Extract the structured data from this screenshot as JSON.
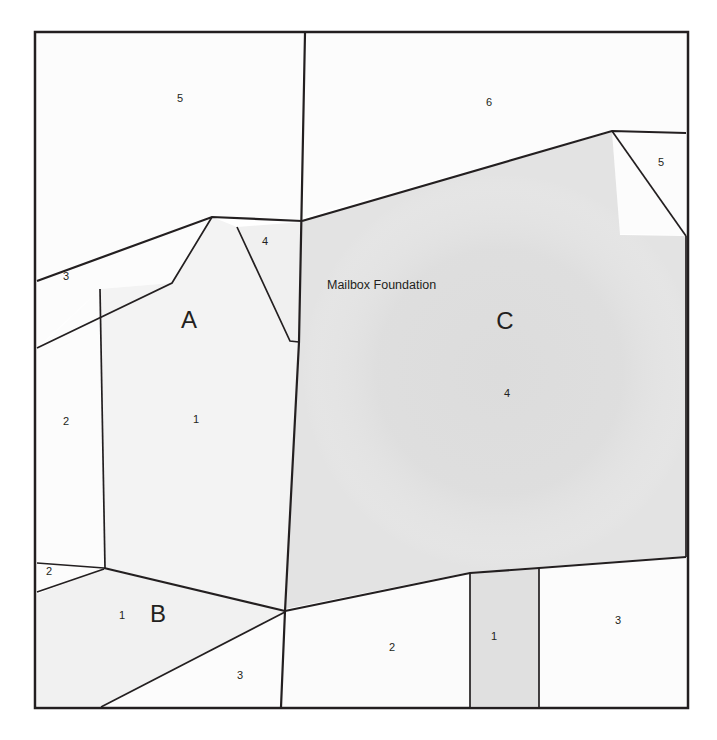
{
  "document": {
    "header_caption": "Survey plat sheet — parcel subdivision",
    "title": "Parcel Plat Diagram"
  },
  "colors": {
    "line": "#231f20",
    "text": "#231f20",
    "parcel_light": "#fbfbfb",
    "parcel_shaded": "#e6e6e6",
    "parcel_shaded_dark": "#dcdcdc",
    "background": "#ffffff",
    "header_text": "#fcfcfc"
  },
  "frame": {
    "x": 35,
    "y": 32,
    "width": 653,
    "height": 676,
    "stroke_width": 2.5
  },
  "annotations": [
    {
      "id": "mailbox-foundation",
      "text": "Mailbox Foundation",
      "x": 327,
      "y": 286
    }
  ],
  "blocks": [
    {
      "id": "block-a",
      "label": "A",
      "x": 189,
      "y": 322
    },
    {
      "id": "block-b",
      "label": "B",
      "x": 158,
      "y": 616
    },
    {
      "id": "block-c",
      "label": "C",
      "x": 505,
      "y": 323
    }
  ],
  "lots": [
    {
      "id": "lot-top-left-5",
      "label": "5",
      "x": 180,
      "y": 99
    },
    {
      "id": "lot-top-right-6",
      "label": "6",
      "x": 489,
      "y": 103
    },
    {
      "id": "lot-right-5",
      "label": "5",
      "x": 661,
      "y": 163
    },
    {
      "id": "lot-left-3",
      "label": "3",
      "x": 66,
      "y": 277
    },
    {
      "id": "lot-mid-4",
      "label": "4",
      "x": 265,
      "y": 242
    },
    {
      "id": "lot-left-2",
      "label": "2",
      "x": 66,
      "y": 422
    },
    {
      "id": "lot-a-1",
      "label": "1",
      "x": 196,
      "y": 420
    },
    {
      "id": "lot-c-4",
      "label": "4",
      "x": 507,
      "y": 394
    },
    {
      "id": "lot-left-small-2",
      "label": "2",
      "x": 49,
      "y": 572
    },
    {
      "id": "lot-b-1",
      "label": "1",
      "x": 122,
      "y": 616
    },
    {
      "id": "lot-bottom-3",
      "label": "3",
      "x": 240,
      "y": 676
    },
    {
      "id": "lot-bottom-2",
      "label": "2",
      "x": 392,
      "y": 648
    },
    {
      "id": "lot-bottom-1",
      "label": "1",
      "x": 494,
      "y": 637
    },
    {
      "id": "lot-bottom-right-3",
      "label": "3",
      "x": 618,
      "y": 621
    }
  ],
  "parcels": [
    {
      "id": "parcel-top-left-5",
      "points": "37,34 303,34 300,222 212,216 37,280",
      "fill": "#fcfcfc"
    },
    {
      "id": "parcel-top-right-6",
      "points": "306,34 686,34 686,133 612,131 302,217",
      "fill": "#fcfcfc"
    },
    {
      "id": "parcel-right-5",
      "points": "612,132 686,134 686,235 620,234",
      "fill": "#fcfcfc"
    },
    {
      "id": "parcel-left-3",
      "points": "37,282 212,217 172,283 100,289 37,348",
      "fill": "#fcfcfc"
    },
    {
      "id": "parcel-mid-4",
      "points": "237,227 302,222 299,341 290,341",
      "fill": "#f0f0f0"
    },
    {
      "id": "parcel-left-2",
      "points": "37,350 100,290 104,568 37,561",
      "fill": "#fcfcfc"
    },
    {
      "id": "parcel-block-a",
      "points": "212,217 237,227 290,341 299,342 285,610 105,568 100,289 172,283",
      "fill": "#f3f3f3"
    },
    {
      "id": "parcel-block-c",
      "points": "302,220 612,132 620,235 686,236 686,556 470,572 285,609 299,342",
      "fill": "#e3e3e3"
    },
    {
      "id": "parcel-left-small-2",
      "points": "37,563 104,568 37,592",
      "fill": "#fcfcfc"
    },
    {
      "id": "parcel-block-b",
      "points": "37,594 104,569 285,611 101,706 37,706",
      "fill": "#f1f1f1"
    },
    {
      "id": "parcel-bottom-3",
      "points": "103,706 285,612 281,706",
      "fill": "#fcfcfc"
    },
    {
      "id": "parcel-bottom-2",
      "points": "286,612 469,573 469,706 282,706",
      "fill": "#fbfbfb"
    },
    {
      "id": "parcel-bottom-1",
      "points": "470,573 539,568 539,706 470,706",
      "fill": "#e0e0e0"
    },
    {
      "id": "parcel-bottom-right-3",
      "points": "540,568 686,558 686,706 540,706",
      "fill": "#fcfcfc"
    }
  ],
  "lines": [
    {
      "id": "line-center-vertical",
      "d": "M 305,33 L 299,342 L 285,611 L 281,707",
      "width": 2.2
    },
    {
      "id": "line-upper-left-diagonal",
      "d": "M 37,281 L 212,217 L 302,221",
      "width": 2.2
    },
    {
      "id": "line-upper-right-diagonal",
      "d": "M 302,221 L 612,131 L 686,133",
      "width": 2.2
    },
    {
      "id": "line-lot3-left-diagonal",
      "d": "M 37,348 L 172,283 L 212,217",
      "width": 1.7
    },
    {
      "id": "line-lot3-vertical",
      "d": "M 100,289 L 105,568",
      "width": 1.7
    },
    {
      "id": "line-lot4-diagonal",
      "d": "M 237,227 L 290,341 L 299,342",
      "width": 1.7
    },
    {
      "id": "line-right-5-diagonal",
      "d": "M 612,131 L 686,236",
      "width": 1.7
    },
    {
      "id": "line-left-small-2-diagonal",
      "d": "M 37,563 L 104,568",
      "width": 1.7
    },
    {
      "id": "line-left-small-2-lower",
      "d": "M 37,592 L 104,569",
      "width": 1.7
    },
    {
      "id": "line-block-b-top",
      "d": "M 104,568 L 285,611",
      "width": 2.2
    },
    {
      "id": "line-block-b-bottom",
      "d": "M 101,707 L 285,612",
      "width": 1.7
    },
    {
      "id": "line-bottom-right-diagonal",
      "d": "M 285,611 L 470,573 L 539,568 L 686,557",
      "width": 2.2
    },
    {
      "id": "line-lot1-left-vertical",
      "d": "M 470,573 L 470,707",
      "width": 1.7
    },
    {
      "id": "line-lot1-right-vertical",
      "d": "M 539,568 L 539,707",
      "width": 1.7
    },
    {
      "id": "line-block-c-right-edge",
      "d": "M 686,236 L 686,557",
      "width": 1.7
    }
  ]
}
